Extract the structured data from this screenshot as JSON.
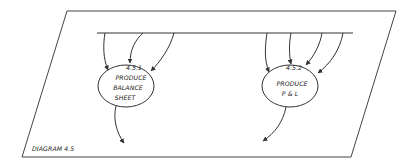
{
  "diagram": {
    "caption": "DIAGRAM 4.5",
    "processes": [
      {
        "id": "4.5.1",
        "lines": [
          "PRODUCE",
          "BALANCE",
          "SHEET"
        ],
        "inputs": 3,
        "outputs": 1
      },
      {
        "id": "4.5.2",
        "lines": [
          "PRODUCE",
          "P & L"
        ],
        "inputs": 4,
        "outputs": 1
      }
    ],
    "colors": {
      "stroke": "#333333",
      "background": "#ffffff"
    }
  }
}
